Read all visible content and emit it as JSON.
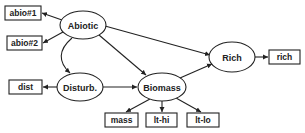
{
  "diagram": {
    "type": "path-diagram",
    "latent_nodes": [
      {
        "id": "abiotic",
        "label": "Abiotic"
      },
      {
        "id": "disturb",
        "label": "Disturb."
      },
      {
        "id": "biomass",
        "label": "Biomass"
      },
      {
        "id": "rich",
        "label": "Rich"
      }
    ],
    "observed_nodes": [
      {
        "id": "abio1",
        "label": "abio#1"
      },
      {
        "id": "abio2",
        "label": "abio#2"
      },
      {
        "id": "dist",
        "label": "dist"
      },
      {
        "id": "mass",
        "label": "mass"
      },
      {
        "id": "lthi",
        "label": "lt-hi"
      },
      {
        "id": "ltlo",
        "label": "lt-lo"
      },
      {
        "id": "richobs",
        "label": "rich"
      }
    ],
    "edges": [
      {
        "from": "Abiotic",
        "to": "abio#1",
        "type": "directed"
      },
      {
        "from": "Abiotic",
        "to": "abio#2",
        "type": "directed"
      },
      {
        "from": "Abiotic",
        "to": "Disturb.",
        "type": "bidirected-curved"
      },
      {
        "from": "Abiotic",
        "to": "Biomass",
        "type": "directed"
      },
      {
        "from": "Abiotic",
        "to": "Rich",
        "type": "directed"
      },
      {
        "from": "Disturb.",
        "to": "dist",
        "type": "directed"
      },
      {
        "from": "Disturb.",
        "to": "Biomass",
        "type": "directed"
      },
      {
        "from": "Biomass",
        "to": "Rich",
        "type": "directed"
      },
      {
        "from": "Biomass",
        "to": "mass",
        "type": "directed"
      },
      {
        "from": "Biomass",
        "to": "lt-hi",
        "type": "directed"
      },
      {
        "from": "Biomass",
        "to": "lt-lo",
        "type": "directed"
      },
      {
        "from": "Rich",
        "to": "rich",
        "type": "directed"
      }
    ],
    "colors": {
      "stroke": "#222222",
      "fill": "#ffffff",
      "text": "#222222"
    }
  }
}
